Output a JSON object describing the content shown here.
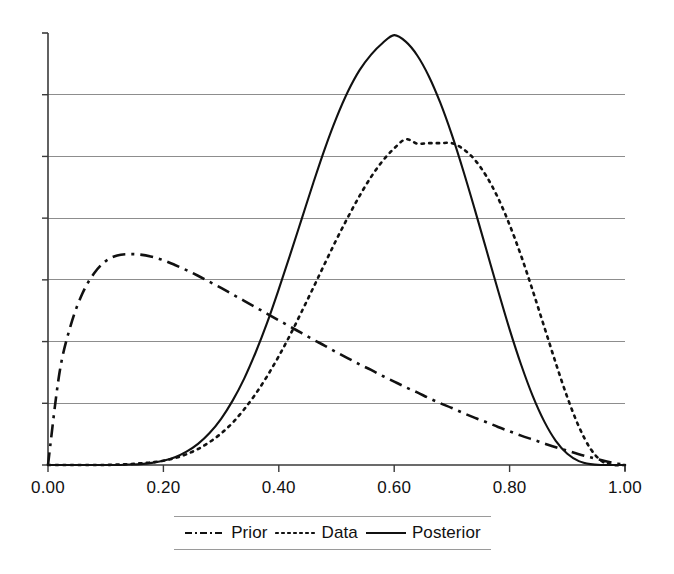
{
  "chart_data": {
    "type": "line",
    "title": "",
    "subtitle": "",
    "xlabel": "",
    "ylabel": "",
    "xlim": [
      0,
      1
    ],
    "ylim": [
      0,
      1
    ],
    "grid": true,
    "grid_axis": "y",
    "y_axis_labels_shown": false,
    "y_tick_count": 7,
    "legend_position": "bottom",
    "x_ticks": [
      {
        "value": 0.0,
        "label": "0.00"
      },
      {
        "value": 0.2,
        "label": "0.20"
      },
      {
        "value": 0.4,
        "label": "0.40"
      },
      {
        "value": 0.6,
        "label": "0.60"
      },
      {
        "value": 0.8,
        "label": "0.80"
      },
      {
        "value": 1.0,
        "label": "1.00"
      }
    ],
    "x": [
      0.0,
      0.02,
      0.04,
      0.06,
      0.08,
      0.1,
      0.12,
      0.14,
      0.16,
      0.18,
      0.2,
      0.22,
      0.24,
      0.26,
      0.28,
      0.3,
      0.32,
      0.34,
      0.36,
      0.38,
      0.4,
      0.42,
      0.44,
      0.46,
      0.48,
      0.5,
      0.52,
      0.54,
      0.56,
      0.58,
      0.6,
      0.62,
      0.64,
      0.66,
      0.68,
      0.7,
      0.72,
      0.74,
      0.76,
      0.78,
      0.8,
      0.82,
      0.84,
      0.86,
      0.88,
      0.9,
      0.92,
      0.94,
      0.96,
      0.98,
      1.0
    ],
    "series": [
      {
        "name": "Prior",
        "style": "dash-dot",
        "color": "#111111",
        "peak_x": 0.16,
        "peak_y": 0.487,
        "values": [
          0.0,
          0.214,
          0.326,
          0.398,
          0.444,
          0.472,
          0.485,
          0.488,
          0.487,
          0.482,
          0.474,
          0.463,
          0.451,
          0.438,
          0.424,
          0.41,
          0.395,
          0.38,
          0.365,
          0.35,
          0.335,
          0.32,
          0.305,
          0.29,
          0.276,
          0.261,
          0.247,
          0.233,
          0.22,
          0.206,
          0.193,
          0.18,
          0.168,
          0.155,
          0.143,
          0.132,
          0.12,
          0.109,
          0.099,
          0.088,
          0.078,
          0.068,
          0.059,
          0.05,
          0.041,
          0.033,
          0.025,
          0.018,
          0.011,
          0.005,
          0.0
        ]
      },
      {
        "name": "Data",
        "style": "dotted",
        "color": "#111111",
        "peak_x": 0.7,
        "peak_y": 0.745,
        "values": [
          0.0,
          0.0,
          0.0,
          0.0,
          0.0,
          0.0,
          0.001,
          0.002,
          0.004,
          0.006,
          0.01,
          0.016,
          0.025,
          0.037,
          0.053,
          0.073,
          0.098,
          0.129,
          0.165,
          0.206,
          0.252,
          0.302,
          0.356,
          0.411,
          0.467,
          0.522,
          0.574,
          0.623,
          0.667,
          0.704,
          0.733,
          0.754,
          0.744,
          0.745,
          0.745,
          0.745,
          0.731,
          0.706,
          0.668,
          0.618,
          0.556,
          0.484,
          0.404,
          0.32,
          0.236,
          0.157,
          0.089,
          0.038,
          0.009,
          0.0,
          0.0
        ]
      },
      {
        "name": "Posterior",
        "style": "solid",
        "color": "#111111",
        "peak_x": 0.6,
        "peak_y": 1.0,
        "values": [
          0.0,
          0.0,
          0.0,
          0.0,
          0.0,
          0.0,
          0.0,
          0.001,
          0.002,
          0.005,
          0.01,
          0.018,
          0.031,
          0.049,
          0.074,
          0.107,
          0.149,
          0.2,
          0.261,
          0.33,
          0.407,
          0.488,
          0.571,
          0.654,
          0.733,
          0.804,
          0.865,
          0.914,
          0.95,
          0.977,
          0.995,
          0.98,
          0.948,
          0.9,
          0.838,
          0.764,
          0.68,
          0.59,
          0.497,
          0.404,
          0.314,
          0.232,
          0.16,
          0.101,
          0.056,
          0.026,
          0.009,
          0.002,
          0.0,
          0.0,
          0.0
        ]
      }
    ]
  },
  "legend": {
    "entries": [
      {
        "label": "Prior",
        "style": "dash-dot"
      },
      {
        "label": "Data",
        "style": "dotted"
      },
      {
        "label": "Posterior",
        "style": "solid"
      }
    ]
  }
}
